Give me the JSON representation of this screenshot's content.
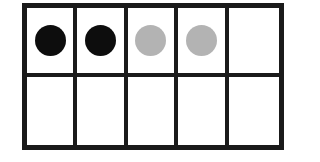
{
  "ten_frame": {
    "rows": 2,
    "columns": 5,
    "cells": [
      {
        "row": 1,
        "col": 1,
        "counter": "black"
      },
      {
        "row": 1,
        "col": 2,
        "counter": "black"
      },
      {
        "row": 1,
        "col": 3,
        "counter": "gray"
      },
      {
        "row": 1,
        "col": 4,
        "counter": "gray"
      },
      {
        "row": 1,
        "col": 5,
        "counter": null
      },
      {
        "row": 2,
        "col": 1,
        "counter": null
      },
      {
        "row": 2,
        "col": 2,
        "counter": null
      },
      {
        "row": 2,
        "col": 3,
        "counter": null
      },
      {
        "row": 2,
        "col": 4,
        "counter": null
      },
      {
        "row": 2,
        "col": 5,
        "counter": null
      }
    ],
    "colors": {
      "black": "#0d0d0d",
      "gray": "#b3b3b3",
      "line": "#1a1a1a"
    }
  }
}
